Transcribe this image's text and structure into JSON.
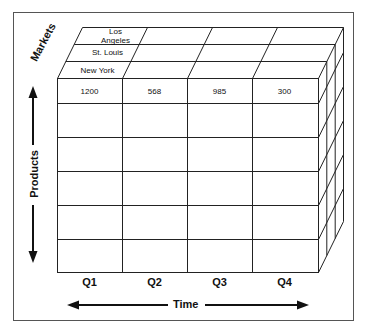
{
  "diagram": {
    "type": "olap-cube",
    "axes": {
      "markets": "Markets",
      "products": "Products",
      "time": "Time"
    },
    "markets": [
      "Los Angeles",
      "St. Louis",
      "New York"
    ],
    "markets_display": {
      "la_line1": "Los",
      "la_line2": "Angeles",
      "stl": "St. Louis",
      "ny": "New York"
    },
    "quarters": [
      "Q1",
      "Q2",
      "Q3",
      "Q4"
    ],
    "first_row_values": [
      "1200",
      "568",
      "985",
      "300"
    ],
    "product_rows": 6,
    "colors": {
      "line": "#222222",
      "frame": "#555555",
      "background": "#ffffff"
    }
  }
}
